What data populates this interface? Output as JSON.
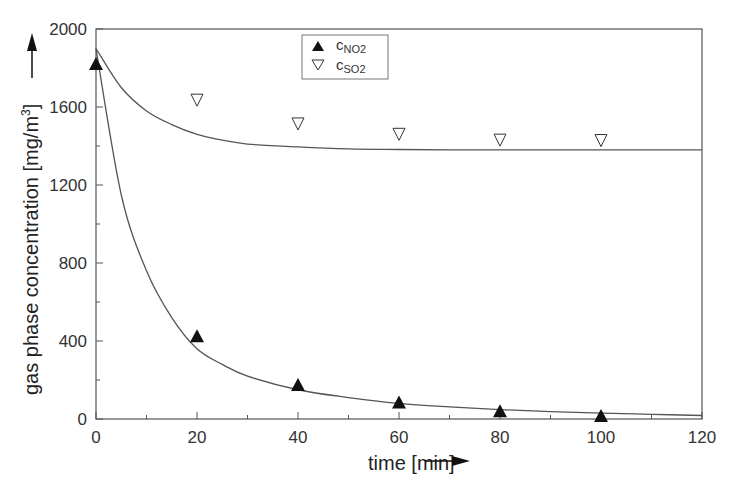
{
  "chart_data": {
    "type": "scatter",
    "title": "",
    "xlabel": "time [min]",
    "ylabel": "gas phase concentration [mg/m3]",
    "ylabel_parts": {
      "main": "gas phase concentration [mg/m",
      "sup": "3",
      "end": "]"
    },
    "xlim": [
      0,
      120
    ],
    "ylim": [
      0,
      2000
    ],
    "xticks": [
      0,
      20,
      40,
      60,
      80,
      100,
      120
    ],
    "yticks": [
      0,
      400,
      800,
      1200,
      1600,
      2000
    ],
    "grid": false,
    "legend_position": "top-center",
    "series": [
      {
        "name": "cNO2",
        "label_main": "c",
        "label_sub": "NO2",
        "marker": "filled-triangle-up",
        "x": [
          0,
          20,
          40,
          60,
          80,
          100
        ],
        "y": [
          1820,
          425,
          175,
          85,
          40,
          15
        ],
        "fit_curve": {
          "x": [
            0,
            5,
            10,
            15,
            20,
            25,
            30,
            40,
            50,
            60,
            70,
            80,
            90,
            100,
            110,
            120
          ],
          "y": [
            1900,
            1150,
            760,
            520,
            360,
            280,
            220,
            150,
            110,
            80,
            62,
            48,
            38,
            30,
            24,
            18
          ]
        }
      },
      {
        "name": "cSO2",
        "label_main": "c",
        "label_sub": "SO2",
        "marker": "open-triangle-down",
        "x": [
          20,
          40,
          60,
          80,
          100
        ],
        "y": [
          1635,
          1513,
          1460,
          1430,
          1428
        ],
        "fit_curve": {
          "x": [
            0,
            5,
            10,
            15,
            20,
            25,
            30,
            40,
            50,
            60,
            70,
            80,
            90,
            100,
            110,
            120
          ],
          "y": [
            1900,
            1700,
            1580,
            1510,
            1460,
            1430,
            1410,
            1395,
            1385,
            1382,
            1380,
            1380,
            1380,
            1380,
            1380,
            1380
          ]
        }
      }
    ]
  },
  "axes": {
    "x_title": "time [min]",
    "y_title_main": "gas phase concentration [mg/m",
    "y_title_sup": "3",
    "y_title_end": "]"
  },
  "legend": {
    "items": [
      {
        "main": "c",
        "sub": "NO2"
      },
      {
        "main": "c",
        "sub": "SO2"
      }
    ]
  }
}
